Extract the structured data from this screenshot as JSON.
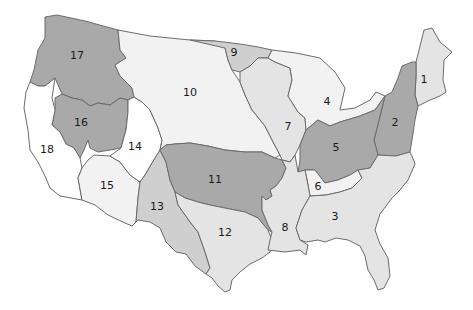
{
  "map": {
    "title": "",
    "colors": {
      "dark": "#a9a9a9",
      "medium": "#cfcfcf",
      "light": "#e4e4e4",
      "lightest": "#f2f2f2",
      "white": "#ffffff",
      "border": "#6b6b6b"
    },
    "regions": [
      {
        "id": 1,
        "label": "1",
        "shade": "light",
        "label_x": 424,
        "label_y": 80
      },
      {
        "id": 2,
        "label": "2",
        "shade": "dark",
        "label_x": 395,
        "label_y": 123
      },
      {
        "id": 3,
        "label": "3",
        "shade": "light",
        "label_x": 335,
        "label_y": 217
      },
      {
        "id": 4,
        "label": "4",
        "shade": "lightest",
        "label_x": 327,
        "label_y": 102
      },
      {
        "id": 5,
        "label": "5",
        "shade": "dark",
        "label_x": 336,
        "label_y": 148
      },
      {
        "id": 6,
        "label": "6",
        "shade": "lightest",
        "label_x": 318,
        "label_y": 187
      },
      {
        "id": 7,
        "label": "7",
        "shade": "light",
        "label_x": 288,
        "label_y": 127
      },
      {
        "id": 8,
        "label": "8",
        "shade": "light",
        "label_x": 285,
        "label_y": 228
      },
      {
        "id": 9,
        "label": "9",
        "shade": "medium",
        "label_x": 234,
        "label_y": 53
      },
      {
        "id": 10,
        "label": "10",
        "shade": "lightest",
        "label_x": 190,
        "label_y": 93
      },
      {
        "id": 11,
        "label": "11",
        "shade": "dark",
        "label_x": 215,
        "label_y": 180
      },
      {
        "id": 12,
        "label": "12",
        "shade": "light",
        "label_x": 225,
        "label_y": 233
      },
      {
        "id": 13,
        "label": "13",
        "shade": "medium",
        "label_x": 157,
        "label_y": 207
      },
      {
        "id": 14,
        "label": "14",
        "shade": "white",
        "label_x": 135,
        "label_y": 147
      },
      {
        "id": 15,
        "label": "15",
        "shade": "lightest",
        "label_x": 107,
        "label_y": 186
      },
      {
        "id": 16,
        "label": "16",
        "shade": "dark",
        "label_x": 81,
        "label_y": 123
      },
      {
        "id": 17,
        "label": "17",
        "shade": "dark",
        "label_x": 77,
        "label_y": 56
      },
      {
        "id": 18,
        "label": "18",
        "shade": "white",
        "label_x": 47,
        "label_y": 150
      }
    ]
  }
}
